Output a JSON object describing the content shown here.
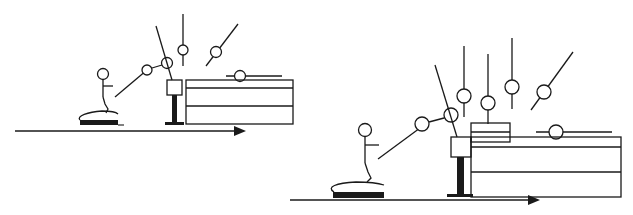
{
  "figure": {
    "panels": [
      {
        "id": "left",
        "label": "",
        "elements": [
          "runway-arrow",
          "springboard",
          "athlete",
          "trajectory",
          "vault-table",
          "mat-stack"
        ]
      },
      {
        "id": "right",
        "label": "",
        "elements": [
          "runway-arrow",
          "springboard",
          "athlete",
          "trajectory",
          "vault-table",
          "raised-block",
          "mat-stack"
        ]
      }
    ],
    "colors": {
      "ink": "#1a1a1a",
      "background": "#ffffff"
    }
  }
}
